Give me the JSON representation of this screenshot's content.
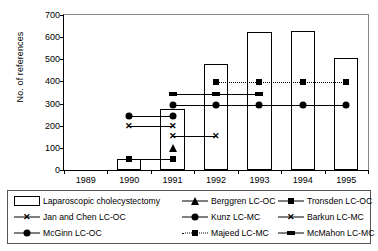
{
  "chart_data": {
    "type": "bar",
    "title": "",
    "xlabel": "",
    "ylabel": "No. of references",
    "ylim": [
      0,
      700
    ],
    "ytick_values": [
      0,
      100,
      200,
      300,
      400,
      500,
      600,
      700
    ],
    "ytick_labels": [
      "0",
      "100",
      "200",
      "300",
      "400",
      "500",
      "600",
      "700"
    ],
    "categories": [
      "1989",
      "1990",
      "1991",
      "1992",
      "1993",
      "1994",
      "1995"
    ],
    "grid": false,
    "legend_position": "below-plot",
    "bar_series": {
      "name": "Laparoscopic cholecystectomy",
      "marker": "open-bar",
      "values": [
        0,
        50,
        275,
        480,
        625,
        627,
        505
      ]
    },
    "series": [
      {
        "name": "Berggren LC-OC",
        "marker": "triangle",
        "line": "solid",
        "points": [
          {
            "x": "1991",
            "y": 105
          }
        ]
      },
      {
        "name": "Tronsden LC-OC",
        "marker": "square",
        "line": "solid",
        "points": [
          {
            "x": "1990",
            "y": 50
          },
          {
            "x": "1991",
            "y": 50
          }
        ]
      },
      {
        "name": "Jan and Chen LC-OC",
        "marker": "cross",
        "line": "solid",
        "points": [
          {
            "x": "1990",
            "y": 200
          },
          {
            "x": "1991",
            "y": 200
          }
        ]
      },
      {
        "name": "Kunz LC-MC",
        "marker": "circle",
        "line": "solid",
        "points": [
          {
            "x": "1991",
            "y": 295
          },
          {
            "x": "1992",
            "y": 295
          },
          {
            "x": "1993",
            "y": 295
          },
          {
            "x": "1994",
            "y": 295
          },
          {
            "x": "1995",
            "y": 295
          }
        ]
      },
      {
        "name": "Barkun LC-MC",
        "marker": "cross",
        "line": "solid",
        "points": [
          {
            "x": "1991",
            "y": 155
          },
          {
            "x": "1992",
            "y": 155
          }
        ]
      },
      {
        "name": "McGinn LC-OC",
        "marker": "circle",
        "line": "solid",
        "points": [
          {
            "x": "1990",
            "y": 245
          },
          {
            "x": "1991",
            "y": 245
          }
        ]
      },
      {
        "name": "Majeed LC-MC",
        "marker": "square",
        "line": "dotted",
        "points": [
          {
            "x": "1992",
            "y": 397
          },
          {
            "x": "1993",
            "y": 397
          },
          {
            "x": "1994",
            "y": 397
          },
          {
            "x": "1995",
            "y": 397
          }
        ]
      },
      {
        "name": "McMahon LC-MC",
        "marker": "wide-square",
        "line": "solid",
        "points": [
          {
            "x": "1991",
            "y": 342
          },
          {
            "x": "1992",
            "y": 342
          },
          {
            "x": "1993",
            "y": 342
          }
        ]
      }
    ]
  },
  "legend": {
    "items": [
      {
        "label": "Laparoscopic cholecystectomy",
        "key": "open-bar",
        "line": "none"
      },
      {
        "label": "Berggren LC-OC",
        "key": "triangle",
        "line": "solid"
      },
      {
        "label": "Tronsden LC-OC",
        "key": "square",
        "line": "solid"
      },
      {
        "label": "Jan and Chen LC-OC",
        "key": "cross",
        "line": "solid"
      },
      {
        "label": "Kunz LC-MC",
        "key": "circle",
        "line": "solid"
      },
      {
        "label": "Barkun LC-MC",
        "key": "cross",
        "line": "solid"
      },
      {
        "label": "McGinn LC-OC",
        "key": "circle",
        "line": "solid"
      },
      {
        "label": "Majeed LC-MC",
        "key": "square",
        "line": "dotted"
      },
      {
        "label": "McMahon LC-MC",
        "key": "wide-square",
        "line": "solid"
      }
    ]
  },
  "colors": {
    "ink": "#000000",
    "frame": "#888888",
    "bar_fill": "#ffffff"
  }
}
